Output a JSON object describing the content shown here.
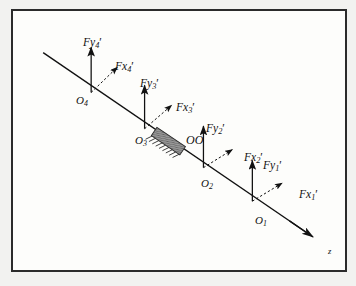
{
  "figure": {
    "kind": "free-body-diagram",
    "caption_text": "",
    "background_color": "#f2f2f0",
    "panel_color": "#fdfdfb",
    "ink_color": "#111111",
    "frame_color": "#2b2b2b",
    "block_fill_color": "#9a9a9a",
    "axis": {
      "label": "z",
      "name": "z-axis",
      "start": {
        "x": 28,
        "y": 46
      },
      "end": {
        "x": 324,
        "y": 248
      },
      "arrow": "at-end"
    },
    "support_block": {
      "label": "OO",
      "name": "bearing-support-block",
      "label_x": 181,
      "label_y": 130,
      "center": {
        "x": 166,
        "y": 144
      },
      "width": 34,
      "height": 11,
      "hatch_count": 9
    },
    "stations": [
      {
        "id": "O1",
        "origin_label": "O",
        "origin_sub": "1",
        "origin_x": 259,
        "origin_y": 210,
        "origin_label_x": 252,
        "origin_label_y": 213,
        "fy_label": "Fy",
        "fy_sub": "1",
        "fy_label_x": 256,
        "fy_label_y": 155,
        "fy_tip_y": 175,
        "fx_label": "Fx",
        "fx_sub": "1",
        "fx_label_x": 293,
        "fx_label_y": 184,
        "fx_tip_x": 288,
        "fx_tip_y": 192
      },
      {
        "id": "O2",
        "origin_label": "O",
        "origin_sub": "2",
        "origin_x": 205,
        "origin_y": 173,
        "origin_label_x": 198,
        "origin_label_y": 176,
        "fy_label": "Fy",
        "fy_sub": "2",
        "fy_label_x": 200,
        "fy_label_y": 118,
        "fy_tip_y": 138,
        "fx_label": "Fx",
        "fx_sub": "2",
        "fx_label_x": 238,
        "fx_label_y": 147,
        "fx_tip_x": 233,
        "fx_tip_y": 155
      },
      {
        "id": "O3",
        "origin_label": "O",
        "origin_sub": "3",
        "origin_x": 140,
        "origin_y": 130,
        "origin_label_x": 129,
        "origin_label_y": 131,
        "fy_label": "Fy",
        "fy_sub": "3",
        "fy_label_x": 134,
        "fy_label_y": 73,
        "fy_tip_y": 93,
        "fx_label": "Fx",
        "fx_sub": "3",
        "fx_label_x": 170,
        "fx_label_y": 97,
        "fx_tip_x": 166,
        "fx_tip_y": 106
      },
      {
        "id": "O4",
        "origin_label": "O",
        "origin_sub": "4",
        "origin_x": 81,
        "origin_y": 90,
        "origin_label_x": 70,
        "origin_label_y": 91,
        "fy_label": "Fy",
        "fy_sub": "4",
        "fy_label_x": 75,
        "fy_label_y": 31,
        "fy_tip_y": 51,
        "fx_label": "Fx",
        "fx_sub": "4",
        "fx_label_x": 109,
        "fx_label_y": 55,
        "fx_tip_x": 105,
        "fx_tip_y": 64
      }
    ]
  }
}
